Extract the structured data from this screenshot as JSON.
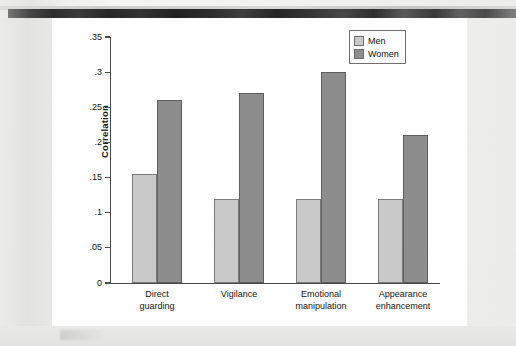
{
  "figure": {
    "background_note": "scanned-page",
    "plate_color": "#fefefe",
    "page_color": "#ebebea"
  },
  "chart_data": {
    "type": "bar",
    "title": "",
    "xlabel": "",
    "ylabel": "Correlation",
    "ylim": [
      0,
      0.35
    ],
    "grid": false,
    "legend_position": "top-right",
    "categories": [
      "Direct guarding",
      "Vigilance",
      "Emotional manipulation",
      "Appearance enhancement"
    ],
    "category_lines": [
      [
        "Direct",
        "guarding"
      ],
      [
        "Vigilance",
        ""
      ],
      [
        "Emotional",
        "manipulation"
      ],
      [
        "Appearance",
        "enhancement"
      ]
    ],
    "series": [
      {
        "name": "Men",
        "color": "#c9c9c9",
        "values": [
          0.155,
          0.12,
          0.12,
          0.12
        ]
      },
      {
        "name": "Women",
        "color": "#8d8d8d",
        "values": [
          0.26,
          0.27,
          0.3,
          0.21
        ]
      }
    ],
    "ytick_values": [
      0,
      0.05,
      0.1,
      0.15,
      0.2,
      0.25,
      0.3,
      0.35
    ],
    "ytick_labels": [
      "0",
      ".05",
      ".1",
      ".15",
      ".2",
      ".25",
      ".3",
      ".35"
    ]
  },
  "legend": {
    "items": [
      {
        "label": "Men",
        "color": "#c9c9c9"
      },
      {
        "label": "Women",
        "color": "#8d8d8d"
      }
    ]
  }
}
